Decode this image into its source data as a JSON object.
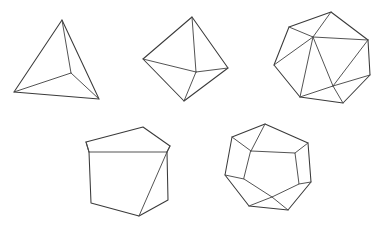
{
  "figure": {
    "background_color": "#ffffff",
    "stroke_color": "#3a3a3a",
    "inner_stroke_color": "#4a4a4a",
    "stroke_width": 1.05,
    "width": 378,
    "height": 230,
    "rows": [
      {
        "row_index": 0,
        "items": [
          "tetrahedron",
          "octahedron",
          "icosahedron"
        ]
      },
      {
        "row_index": 1,
        "items": [
          "cube",
          "dodecahedron"
        ]
      }
    ]
  },
  "solids": [
    {
      "id": "tetrahedron",
      "name": "Tetrahedron",
      "faces": 4,
      "vertices_count": 4,
      "edges_count": 6,
      "face_shape": "triangle",
      "position": "top-left",
      "vertices": [
        [
          62,
          20
        ],
        [
          14,
          92
        ],
        [
          99,
          99
        ],
        [
          71,
          73
        ]
      ],
      "outline_path": "M 62 20 L 14 92 L 99 99 Z",
      "inner_paths": [
        "M 71 73 L 62 20",
        "M 71 73 L 14 92",
        "M 71 73 L 99 99"
      ]
    },
    {
      "id": "octahedron",
      "name": "Octahedron",
      "faces": 8,
      "vertices_count": 6,
      "edges_count": 12,
      "face_shape": "triangle",
      "position": "top-middle",
      "vertices": [
        [
          192,
          17
        ],
        [
          143,
          59
        ],
        [
          228,
          68
        ],
        [
          184,
          101
        ],
        [
          196,
          72
        ]
      ],
      "outline_path": "M 192 17 L 143 59 L 184 101 L 228 68 Z",
      "inner_paths": [
        "M 192 17 L 196 72",
        "M 143 59 L 196 72",
        "M 228 68 L 196 72",
        "M 184 101 L 196 72"
      ]
    },
    {
      "id": "icosahedron",
      "name": "Icosahedron",
      "faces": 20,
      "vertices_count": 12,
      "edges_count": 30,
      "face_shape": "triangle",
      "position": "top-right",
      "vertices": [
        [
          331,
          12
        ],
        [
          289,
          27
        ],
        [
          274,
          65
        ],
        [
          300,
          97
        ],
        [
          343,
          103
        ],
        [
          370,
          75
        ],
        [
          368,
          40
        ],
        [
          313,
          37
        ],
        [
          333,
          86
        ]
      ],
      "outline_path": "M 331 12 L 289 27 L 274 65 L 300 97 L 343 103 L 370 75 L 368 40 Z",
      "inner_paths": [
        "M 289 27 L 313 37",
        "M 331 12 L 313 37",
        "M 368 40 L 313 37",
        "M 274 65 L 313 37",
        "M 300 97 L 313 37",
        "M 333 86 L 313 37",
        "M 370 75 L 333 86",
        "M 343 103 L 333 86",
        "M 300 97 L 333 86",
        "M 368 40 L 333 86"
      ]
    },
    {
      "id": "cube",
      "name": "Cube",
      "faces": 6,
      "vertices_count": 8,
      "edges_count": 12,
      "face_shape": "square",
      "position": "bottom-left",
      "vertices": [
        [
          86,
          142
        ],
        [
          143,
          127
        ],
        [
          170,
          146
        ],
        [
          89,
          152
        ],
        [
          167,
          152
        ],
        [
          91,
          203
        ],
        [
          139,
          216
        ],
        [
          168,
          200
        ]
      ],
      "outline_path": "M 86 142 L 143 127 L 170 146 L 167 152 L 168 200 L 139 216 L 91 203 L 89 152 Z",
      "inner_paths": [
        "M 89 152 L 167 152",
        "M 167 152 L 170 146",
        "M 89 152 L 86 142",
        "M 139 216 L 167 152"
      ]
    },
    {
      "id": "dodecahedron",
      "name": "Dodecahedron",
      "faces": 12,
      "vertices_count": 20,
      "edges_count": 30,
      "face_shape": "pentagon",
      "position": "bottom-right",
      "vertices": [
        [
          265,
          124
        ],
        [
          232,
          137
        ],
        [
          225,
          175
        ],
        [
          249,
          206
        ],
        [
          288,
          210
        ],
        [
          311,
          182
        ],
        [
          308,
          143
        ],
        [
          251,
          151
        ],
        [
          244,
          179
        ],
        [
          272,
          197
        ],
        [
          299,
          184
        ],
        [
          295,
          153
        ]
      ],
      "outline_path": "M 265 124 L 232 137 L 225 175 L 249 206 L 288 210 L 311 182 L 308 143 Z",
      "inner_paths": [
        "M 251 151 L 295 153 L 299 184 L 272 197 L 244 179 Z",
        "M 265 124 L 251 151",
        "M 232 137 L 251 151",
        "M 308 143 L 295 153",
        "M 225 175 L 244 179",
        "M 249 206 L 272 197",
        "M 288 210 L 272 197",
        "M 311 182 L 299 184"
      ]
    }
  ]
}
